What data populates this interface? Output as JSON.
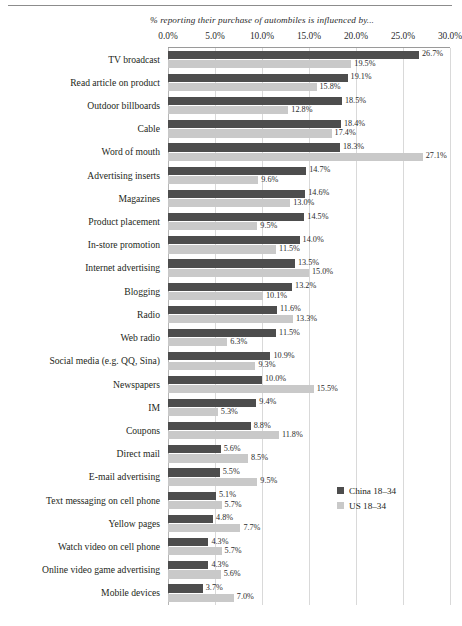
{
  "chart_data": {
    "type": "bar",
    "orientation": "horizontal",
    "title": "% reporting their purchase of autombiles is influenced by...",
    "xlabel": "",
    "ylabel": "",
    "xlim": [
      0,
      30
    ],
    "grid": true,
    "legend_position": "middle-right",
    "tick_labels": [
      "0.0%",
      "5.0%",
      "10.0%",
      "15.0%",
      "20.0%",
      "25.0%",
      "30.0%"
    ],
    "tick_values": [
      0,
      5,
      10,
      15,
      20,
      25,
      30
    ],
    "categories": [
      "TV broadcast",
      "Read article on product",
      "Outdoor billboards",
      "Cable",
      "Word of mouth",
      "Advertising inserts",
      "Magazines",
      "Product placement",
      "In-store promotion",
      "Internet advertising",
      "Blogging",
      "Radio",
      "Web radio",
      "Social media (e.g. QQ, Sina)",
      "Newspapers",
      "IM",
      "Coupons",
      "Direct mail",
      "E-mail advertising",
      "Text messaging on cell phone",
      "Yellow pages",
      "Watch video on cell phone",
      "Online video game advertising",
      "Mobile devices"
    ],
    "series": [
      {
        "name": "China 18–34",
        "color": "#4d4d4d",
        "values": [
          26.7,
          19.1,
          18.5,
          18.4,
          18.3,
          14.7,
          14.6,
          14.5,
          14.0,
          13.5,
          13.2,
          11.6,
          11.5,
          10.9,
          10.0,
          9.4,
          8.8,
          5.6,
          5.5,
          5.1,
          4.8,
          4.3,
          4.3,
          3.7
        ],
        "labels": [
          "26.7%",
          "19.1%",
          "18.5%",
          "18.4%",
          "18.3%",
          "14.7%",
          "14.6%",
          "14.5%",
          "14.0%",
          "13.5%",
          "13.2%",
          "11.6%",
          "11.5%",
          "10.9%",
          "10.0%",
          "9.4%",
          "8.8%",
          "5.6%",
          "5.5%",
          "5.1%",
          "4.8%",
          "4.3%",
          "4.3%",
          "3.7%"
        ]
      },
      {
        "name": "US 18–34",
        "color": "#c9c9c9",
        "values": [
          19.5,
          15.8,
          12.8,
          17.4,
          27.1,
          9.6,
          13.0,
          9.5,
          11.5,
          15.0,
          10.1,
          13.3,
          6.3,
          9.3,
          15.5,
          5.3,
          11.8,
          8.5,
          9.5,
          5.7,
          7.7,
          5.7,
          5.6,
          7.0
        ],
        "labels": [
          "19.5%",
          "15.8%",
          "12.8%",
          "17.4%",
          "27.1%",
          "9.6%",
          "13.0%",
          "9.5%",
          "11.5%",
          "15.0%",
          "10.1%",
          "13.3%",
          "6.3%",
          "9.3%",
          "15.5%",
          "5.3%",
          "11.8%",
          "8.5%",
          "9.5%",
          "5.7%",
          "7.7%",
          "5.7%",
          "5.6%",
          "7.0%"
        ]
      }
    ]
  },
  "legend": {
    "items": [
      {
        "label": "China 18–34",
        "color": "#4d4d4d"
      },
      {
        "label": "US 18–34",
        "color": "#c9c9c9"
      }
    ]
  }
}
